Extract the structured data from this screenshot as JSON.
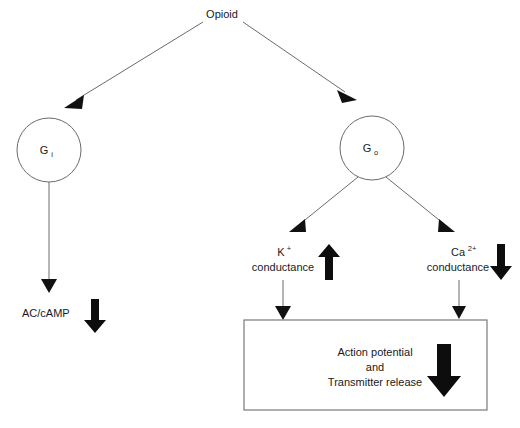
{
  "diagram": {
    "title_node": {
      "label": "Opioid"
    },
    "g_proteins": [
      {
        "id": "gi",
        "base": "G",
        "sub": "i"
      },
      {
        "id": "go",
        "base": "G",
        "sub": "o"
      }
    ],
    "effectors": [
      {
        "id": "ac-camp",
        "label": "AC/cAMP",
        "label_line2": "",
        "sup": "",
        "change": "decrease",
        "change_symbol": "↓"
      },
      {
        "id": "k-conductance",
        "label": "K",
        "sup": "+",
        "label_line2": "conductance",
        "change": "increase",
        "change_symbol": "↑"
      },
      {
        "id": "ca-conductance",
        "label": "Ca",
        "sup": "2+",
        "label_line2": "conductance",
        "change": "decrease",
        "change_symbol": "↓"
      }
    ],
    "outcome_box": {
      "line1": "Action potential",
      "line2": "and",
      "line3": "Transmitter release",
      "change": "decrease",
      "change_symbol": "↓"
    },
    "colors": {
      "stroke": "#6b6b6b",
      "arrow_fill": "#0d0d0d",
      "text": "#1a1a1a",
      "background": "#ffffff"
    }
  }
}
